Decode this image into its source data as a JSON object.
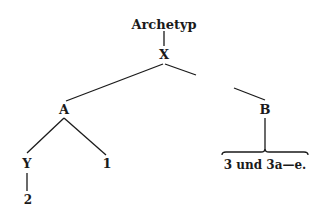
{
  "diagram": {
    "type": "stemma",
    "nodes": {
      "archetyp": "Archetyp",
      "x": "X",
      "a": "A",
      "b": "B",
      "y": "Y",
      "one": "1",
      "two": "2",
      "b_children": "3 und 3a—e."
    },
    "edges": [
      [
        "Archetyp",
        "X"
      ],
      [
        "X",
        "A"
      ],
      [
        "X",
        "B"
      ],
      [
        "A",
        "Y"
      ],
      [
        "A",
        "1"
      ],
      [
        "Y",
        "2"
      ],
      [
        "B",
        "3 und 3a—e."
      ]
    ],
    "line_color": "#1a1a1a"
  }
}
